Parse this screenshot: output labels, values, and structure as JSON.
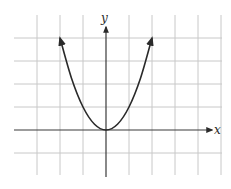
{
  "chart_data": {
    "type": "line",
    "title": "",
    "xlabel": "x",
    "ylabel": "y",
    "xlim": [
      -3,
      5
    ],
    "ylim": [
      -1,
      4
    ],
    "grid": true,
    "grid_step": 1,
    "tick_labels_shown": false,
    "axis_arrows": [
      "x-positive",
      "y-positive"
    ],
    "series": [
      {
        "name": "parabola",
        "curve_arrows": "both-ends",
        "x": [
          -2,
          -1.5,
          -1,
          -0.5,
          0,
          0.5,
          1,
          1.5,
          2
        ],
        "y": [
          4,
          2.25,
          1,
          0.25,
          0,
          0.25,
          1,
          2.25,
          4
        ]
      }
    ],
    "colors": {
      "grid": "#c8c8c8",
      "axis": "#3a3a3a",
      "curve": "#2a2a2a"
    }
  }
}
